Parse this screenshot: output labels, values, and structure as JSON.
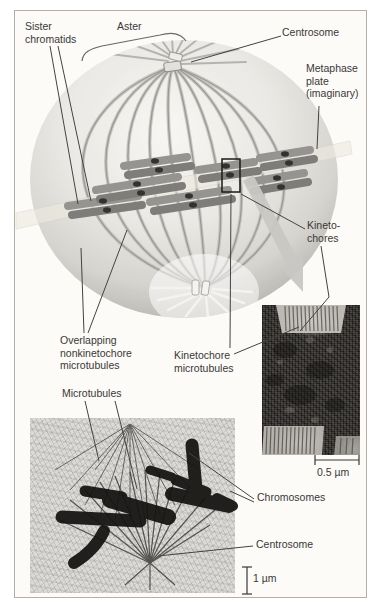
{
  "labels": {
    "sister_chromatids": "Sister\nchromatids",
    "aster": "Aster",
    "centrosome_top": "Centrosome",
    "metaphase_plate": "Metaphase\nplate\n(imaginary)",
    "kinetochores": "Kineto-\nchores",
    "overlapping_nonkinetochore_microtubules": "Overlapping\nnonkinetochore\nmicrotubules",
    "kinetochore_microtubules": "Kinetochore\nmicrotubules",
    "microtubules": "Microtubules",
    "chromosomes": "Chromosomes",
    "centrosome_bottom": "Centrosome",
    "scale_bar_tem": "0.5 µm",
    "scale_bar_lm": "1 µm"
  },
  "colors": {
    "label_text": "#3a3836",
    "leader_line": "#45433f",
    "frame_border": "#b6b0a4",
    "cell_surface": "#e9e8e4",
    "spindle_fiber": "#9b9994",
    "chromosome": "#8b8984",
    "kinetochore": "#343230",
    "metaphase_plate_band": "#eceadf",
    "zoom_arrow": "#cac8c4"
  }
}
